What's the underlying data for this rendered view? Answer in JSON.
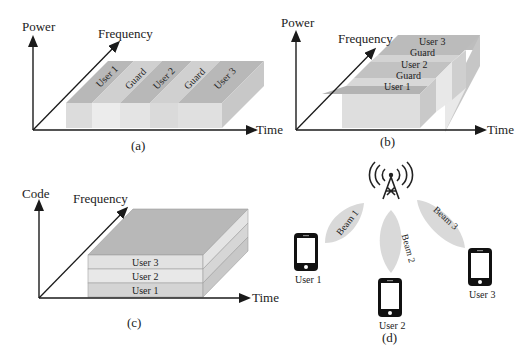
{
  "panels": {
    "a": {
      "caption": "(a)",
      "y_axis": "Power",
      "diag_axis": "Frequency",
      "x_axis": "Time",
      "blocks": [
        "User 1",
        "Guard",
        "User 2",
        "Guard",
        "User 3"
      ]
    },
    "b": {
      "caption": "(b)",
      "y_axis": "Power",
      "diag_axis": "Frequency",
      "x_axis": "Time",
      "blocks": [
        "User 1",
        "Guard",
        "User 2",
        "Guard",
        "User 3"
      ]
    },
    "c": {
      "caption": "(c)",
      "y_axis": "Code",
      "diag_axis": "Frequency",
      "x_axis": "Time",
      "layers": [
        "User 3",
        "User 2",
        "User 1"
      ]
    },
    "d": {
      "caption": "(d)",
      "beams": [
        "Beam 1",
        "Beam 2",
        "Beam 3"
      ],
      "users": [
        "User 1",
        "User 2",
        "User 3"
      ],
      "icons": [
        "antenna-tower-icon",
        "smartphone-icon"
      ]
    }
  },
  "colors": {
    "axis": "#1a1a1a",
    "user_top": "#b5b5b5",
    "guard_top": "#cfcfcf",
    "front_user": "#dcdcdc",
    "front_guard": "#ececec",
    "side": "#c6c6c6",
    "beam": "#d9d9d9"
  }
}
